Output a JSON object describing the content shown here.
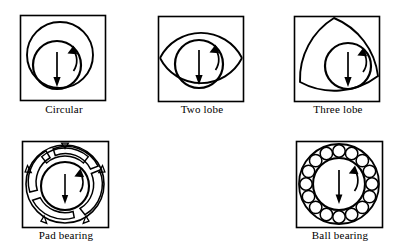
{
  "figure": {
    "background_color": "#ffffff",
    "line_color": "#000000",
    "label_font_size_px": 11
  },
  "diagram_data": {
    "type": "diagram",
    "subject": "bearing cross sections",
    "arrow_semantics": {
      "straight_arrow": "load direction (downward)",
      "curved_arrow": "journal rotation direction"
    },
    "panels": [
      {
        "id": "circular",
        "label": "Circular",
        "row": 1,
        "column": 1,
        "frame": {
          "x": 20,
          "y": 15,
          "width": 86,
          "height": 86
        },
        "bore_shape": "circle",
        "bore": {
          "cx": 60,
          "cy": 55,
          "r": 33
        },
        "journal": {
          "cx": 57,
          "cy": 65,
          "r": 24
        },
        "lobes": 1,
        "load_arrow": {
          "x": 57,
          "y1": 52,
          "y2": 84,
          "direction": "down"
        },
        "rotation_arrow": {
          "direction": "clockwise"
        },
        "label_x_center": 63,
        "label_y": 108
      },
      {
        "id": "two-lobe",
        "label": "Two lobe",
        "row": 1,
        "column": 2,
        "frame": {
          "x": 158,
          "y": 16,
          "width": 85,
          "height": 85
        },
        "bore_shape": "lens",
        "bore": {
          "cx": 200,
          "cy": 56,
          "rx": 41,
          "ry": 30
        },
        "journal": {
          "cx": 198,
          "cy": 63,
          "r": 24
        },
        "lobes": 2,
        "load_arrow": {
          "x": 198,
          "y1": 50,
          "y2": 82,
          "direction": "down"
        },
        "rotation_arrow": {
          "direction": "clockwise"
        },
        "label_x_center": 200,
        "label_y": 108
      },
      {
        "id": "three-lobe",
        "label": "Three lobe",
        "row": 1,
        "column": 3,
        "frame": {
          "x": 294,
          "y": 16,
          "width": 85,
          "height": 85
        },
        "bore_shape": "reuleaux-triangle",
        "bore": {
          "cx": 334,
          "cy": 57,
          "r": 39
        },
        "journal": {
          "cx": 348,
          "cy": 66,
          "r": 23
        },
        "lobes": 3,
        "load_arrow": {
          "x": 348,
          "y1": 53,
          "y2": 85,
          "direction": "down"
        },
        "rotation_arrow": {
          "direction": "clockwise"
        },
        "label_x_center": 336,
        "label_y": 108
      },
      {
        "id": "pad-bearing",
        "label": "Pad bearing",
        "row": 2,
        "column": 1,
        "frame": {
          "x": 22,
          "y": 141,
          "width": 86,
          "height": 86
        },
        "bore_shape": "tilting-pads",
        "pad_count": 5,
        "pivot_count": 5,
        "bore": {
          "cx": 65,
          "cy": 184,
          "r": 39
        },
        "journal": {
          "cx": 65,
          "cy": 186,
          "r": 24
        },
        "load_arrow": {
          "x": 65,
          "y1": 174,
          "y2": 204,
          "direction": "down"
        },
        "rotation_arrow": {
          "direction": "clockwise"
        },
        "label_x_center": 65,
        "label_y": 234
      },
      {
        "id": "ball-bearing",
        "label": "Ball bearing",
        "row": 2,
        "column": 3,
        "frame": {
          "x": 296,
          "y": 141,
          "width": 86,
          "height": 86
        },
        "bore_shape": "rolling-elements",
        "ball_count": 16,
        "outer_race": {
          "cx": 339,
          "cy": 184,
          "r": 40
        },
        "inner_race": {
          "cx": 339,
          "cy": 184,
          "r": 26
        },
        "ball_radius": 6.2,
        "ball_ring_radius": 33,
        "load_arrow": {
          "x": 339,
          "y1": 170,
          "y2": 204,
          "direction": "down"
        },
        "rotation_arrow": {
          "direction": "clockwise"
        },
        "label_x_center": 339,
        "label_y": 234
      }
    ]
  }
}
